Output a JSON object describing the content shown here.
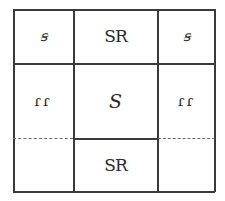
{
  "diagram": {
    "type": "3x3 grid",
    "cells": [
      {
        "row": 0,
        "col": 0,
        "symbol": "ꞩ",
        "label": "s"
      },
      {
        "row": 0,
        "col": 1,
        "symbol": "SR",
        "label": "SR"
      },
      {
        "row": 0,
        "col": 2,
        "symbol": "ꞩ",
        "label": "s"
      },
      {
        "row": 1,
        "col": 0,
        "symbol": "ɾɾ",
        "label": "rr"
      },
      {
        "row": 1,
        "col": 1,
        "symbol": "S",
        "label": "S"
      },
      {
        "row": 1,
        "col": 2,
        "symbol": "ɾɾ",
        "label": "rr"
      },
      {
        "row": 2,
        "col": 0,
        "symbol": "",
        "label": ""
      },
      {
        "row": 2,
        "col": 1,
        "symbol": "SR",
        "label": "SR"
      },
      {
        "row": 2,
        "col": 2,
        "symbol": "",
        "label": ""
      }
    ],
    "colors": {
      "line": "#3a3a3a",
      "text": "#2a2a2a",
      "background": "#ffffff"
    }
  }
}
